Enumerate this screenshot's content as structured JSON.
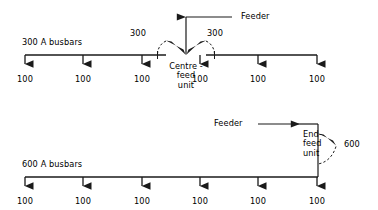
{
  "figure": {
    "type": "electrical-busbar-distribution-diagram",
    "line_color": "#1a1a1a",
    "text_color": "#000000",
    "background": "#ffffff"
  },
  "diagrams": [
    {
      "id": "centre-feed",
      "busbar_label": "300 A busbars",
      "feeder_label": "Feeder",
      "unit_label": "Centre -\nfeed\nunit",
      "unit_label_lines": [
        "Centre -",
        "feed",
        "unit"
      ],
      "rating_left": "300",
      "rating_right": "300",
      "tap_loads": [
        "100",
        "100",
        "100",
        "100",
        "100",
        "100"
      ]
    },
    {
      "id": "end-feed",
      "busbar_label": "600 A busbars",
      "feeder_label": "Feeder",
      "unit_label_lines": [
        "End-",
        "feed",
        "unit"
      ],
      "rating_right": "600",
      "tap_loads": [
        "100",
        "100",
        "100",
        "100",
        "100",
        "100"
      ]
    }
  ]
}
